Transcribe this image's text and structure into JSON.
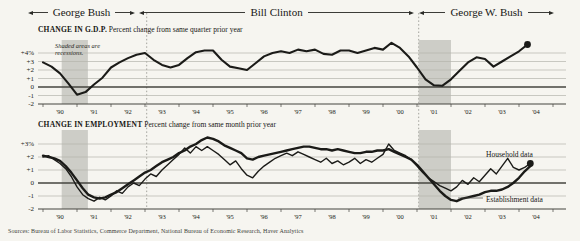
{
  "header": {
    "presidents": [
      {
        "label": "George Bush"
      },
      {
        "label": "Bill Clinton"
      },
      {
        "label": "George W. Bush"
      }
    ]
  },
  "transitions_years": [
    1993.05,
    2001.05
  ],
  "source": "Sources: Bureau of Labor Statistics, Commerce Department, National Bureau of Economic Research, Haver Analytics",
  "colors": {
    "line": "#1b1b18",
    "band": "#c6c5bf",
    "grid": "#b5b4ac",
    "axis": "#45453f",
    "dotted": "#8d8d86",
    "paper": "#f6f5f0"
  },
  "chart_data": [
    {
      "id": "gdp",
      "type": "line",
      "title": "CHANGE IN G.D.P.",
      "subtitle": "Percent change from same quarter prior year",
      "note": "Shaded areas are recessions.",
      "ylim": [
        -2,
        5.5
      ],
      "x_range": [
        1989.85,
        2005.5
      ],
      "yticks": [
        {
          "v": 4,
          "label": "+4%"
        },
        {
          "v": 3,
          "label": "+3"
        },
        {
          "v": 2,
          "label": "+2"
        },
        {
          "v": 1,
          "label": "+1"
        },
        {
          "v": 0,
          "label": "0"
        },
        {
          "v": -1,
          "label": "-1"
        },
        {
          "v": -2,
          "label": "-2"
        }
      ],
      "x_tick_labels": [
        "'90",
        "'91",
        "'92",
        "'93",
        "'94",
        "'95",
        "'96",
        "'97",
        "'98",
        "'99",
        "'00",
        "'01",
        "'02",
        "'03",
        "'04"
      ],
      "recessions": [
        [
          1990.55,
          1991.32
        ],
        [
          2001.05,
          2002.0
        ]
      ],
      "series": [
        {
          "name": "G.D.P. percent change from same quarter prior year",
          "slug": "gdp",
          "x0": 1990.0,
          "dx": 0.25,
          "width": 2.1,
          "end_dot": true,
          "values": [
            2.9,
            2.4,
            1.6,
            0.4,
            -0.9,
            -0.6,
            0.3,
            1.1,
            2.3,
            2.9,
            3.4,
            3.8,
            4.0,
            3.2,
            2.6,
            2.3,
            2.6,
            3.4,
            4.1,
            4.3,
            4.3,
            3.2,
            2.4,
            2.2,
            2.0,
            2.8,
            3.6,
            4.0,
            4.2,
            4.0,
            4.4,
            4.2,
            4.4,
            3.9,
            3.8,
            4.3,
            4.3,
            4.0,
            4.3,
            4.6,
            4.4,
            5.2,
            4.6,
            3.6,
            2.3,
            0.9,
            0.2,
            0.15,
            0.9,
            1.9,
            2.9,
            3.5,
            3.3,
            2.4,
            3.0,
            3.6,
            4.2,
            5.0
          ]
        }
      ],
      "annotations": []
    },
    {
      "id": "employment",
      "type": "line",
      "title": "CHANGE IN EMPLOYMENT",
      "subtitle": "Percent change from same month prior year",
      "ylim": [
        -2,
        4
      ],
      "x_range": [
        1989.85,
        2005.5
      ],
      "yticks": [
        {
          "v": 3,
          "label": "+3%"
        },
        {
          "v": 2,
          "label": "+2"
        },
        {
          "v": 1,
          "label": "+1"
        },
        {
          "v": 0,
          "label": "0"
        },
        {
          "v": -1,
          "label": "-1"
        },
        {
          "v": -2,
          "label": "-2"
        }
      ],
      "x_tick_labels": [
        "'90",
        "'91",
        "'92",
        "'93",
        "'94",
        "'95",
        "'96",
        "'97",
        "'98",
        "'99",
        "'00",
        "'01",
        "'02",
        "'03",
        "'04"
      ],
      "recessions": [
        [
          1990.55,
          1991.32
        ],
        [
          2001.05,
          2002.0
        ]
      ],
      "series": [
        {
          "name": "Establishment data",
          "slug": "establishment-data",
          "x0": 1990.0,
          "dx": 0.16667,
          "width": 2.4,
          "end_dot": false,
          "values": [
            2.1,
            2.0,
            1.9,
            1.7,
            1.3,
            0.8,
            0.2,
            -0.4,
            -0.9,
            -1.1,
            -1.2,
            -1.1,
            -0.9,
            -0.7,
            -0.4,
            -0.1,
            0.2,
            0.5,
            0.8,
            1.0,
            1.3,
            1.6,
            1.8,
            2.0,
            2.3,
            2.5,
            2.8,
            3.0,
            3.3,
            3.5,
            3.4,
            3.2,
            2.9,
            2.7,
            2.5,
            2.3,
            1.9,
            1.8,
            2.0,
            2.1,
            2.2,
            2.3,
            2.4,
            2.5,
            2.6,
            2.7,
            2.8,
            2.8,
            2.7,
            2.6,
            2.6,
            2.5,
            2.6,
            2.5,
            2.4,
            2.3,
            2.3,
            2.4,
            2.4,
            2.5,
            2.5,
            2.6,
            2.4,
            2.2,
            2.0,
            1.8,
            1.4,
            0.9,
            0.4,
            -0.1,
            -0.6,
            -1.0,
            -1.3,
            -1.4,
            -1.2,
            -1.1,
            -1.0,
            -0.9,
            -0.7,
            -0.6,
            -0.6,
            -0.5,
            -0.3,
            0.0,
            0.4,
            0.9,
            1.3
          ]
        },
        {
          "name": "Household data",
          "slug": "household-data",
          "x0": 1990.0,
          "dx": 0.16667,
          "width": 1.4,
          "end_dot": true,
          "values": [
            2.0,
            2.1,
            1.8,
            1.5,
            1.1,
            0.5,
            -0.3,
            -0.9,
            -1.2,
            -1.4,
            -1.1,
            -1.3,
            -1.0,
            -0.6,
            -0.8,
            -0.3,
            0.0,
            -0.2,
            0.3,
            0.7,
            0.5,
            1.0,
            1.4,
            1.8,
            2.2,
            2.7,
            2.3,
            2.8,
            2.5,
            2.8,
            2.5,
            2.2,
            1.8,
            1.4,
            1.7,
            1.1,
            0.6,
            0.4,
            0.9,
            1.3,
            1.6,
            1.9,
            2.1,
            2.3,
            2.1,
            2.4,
            2.2,
            2.0,
            1.8,
            1.6,
            1.9,
            1.5,
            1.7,
            1.4,
            1.6,
            1.9,
            1.5,
            1.8,
            1.6,
            1.9,
            2.2,
            3.0,
            2.5,
            2.3,
            2.1,
            1.8,
            1.3,
            0.8,
            0.4,
            0.1,
            -0.2,
            -0.4,
            -0.6,
            -0.3,
            0.2,
            -0.1,
            0.4,
            0.1,
            0.6,
            1.1,
            0.7,
            1.3,
            1.9,
            1.2,
            1.0,
            1.2,
            1.5
          ]
        }
      ],
      "annotations": [
        {
          "text": "Household data",
          "x": 486,
          "y": 157
        },
        {
          "text": "Establishment data",
          "x": 486,
          "y": 202,
          "leader": [
            458,
            198,
            483,
            198
          ]
        }
      ]
    }
  ]
}
